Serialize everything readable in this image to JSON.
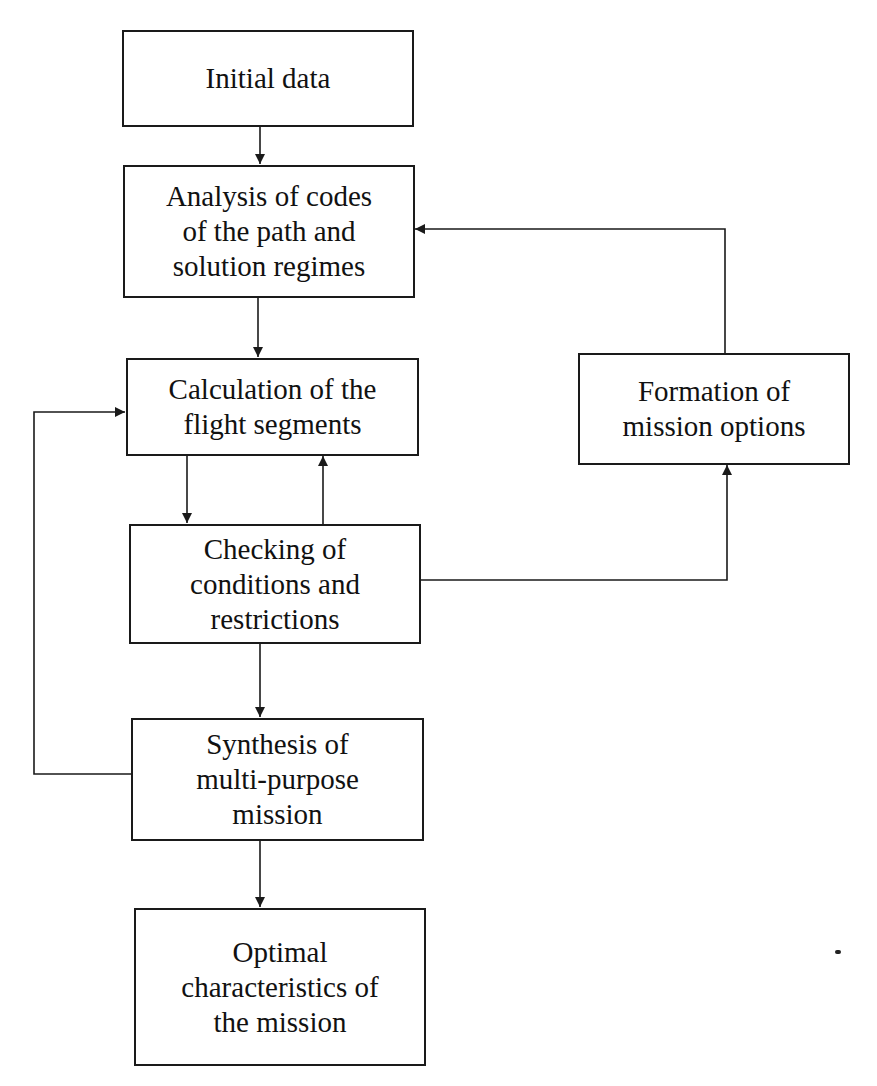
{
  "diagram": {
    "type": "flowchart",
    "colors": {
      "line": "#1a1a1a",
      "text": "#111111",
      "background": "#ffffff"
    },
    "nodes": [
      {
        "id": "initial_data",
        "label": "Initial data"
      },
      {
        "id": "analysis",
        "label": "Analysis of codes\nof the path and\nsolution regimes"
      },
      {
        "id": "calculation",
        "label": "Calculation of the\nflight segments"
      },
      {
        "id": "checking",
        "label": "Checking of\nconditions and\nrestrictions"
      },
      {
        "id": "synthesis",
        "label": "Synthesis of\nmulti-purpose\nmission"
      },
      {
        "id": "optimal",
        "label": "Optimal\ncharacteristics of\nthe mission"
      },
      {
        "id": "formation",
        "label": "Formation of\nmission options"
      }
    ],
    "edges": [
      {
        "from": "initial_data",
        "to": "analysis"
      },
      {
        "from": "analysis",
        "to": "calculation"
      },
      {
        "from": "calculation",
        "to": "checking"
      },
      {
        "from": "checking",
        "to": "calculation"
      },
      {
        "from": "checking",
        "to": "formation"
      },
      {
        "from": "formation",
        "to": "analysis"
      },
      {
        "from": "checking",
        "to": "synthesis"
      },
      {
        "from": "synthesis",
        "to": "calculation"
      },
      {
        "from": "synthesis",
        "to": "optimal"
      }
    ]
  }
}
